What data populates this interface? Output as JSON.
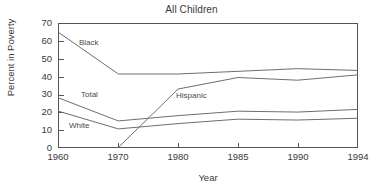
{
  "chart_data": {
    "type": "line",
    "title": "All Children",
    "xlabel": "Year",
    "ylabel": "Percent in Poverty",
    "categories": [
      "1960",
      "1970",
      "1980",
      "1985",
      "1990",
      "1994"
    ],
    "x": [
      1960,
      1970,
      1980,
      1985,
      1990,
      1994
    ],
    "ylim": [
      0,
      70
    ],
    "yticks": [
      0,
      10,
      20,
      30,
      40,
      50,
      60,
      70
    ],
    "ytick_labels": [
      "0",
      "10",
      "20",
      "30",
      "40",
      "50",
      "60",
      "70"
    ],
    "xtick_labels": [
      "1960",
      "1970",
      "1980",
      "1985",
      "1990",
      "1994"
    ],
    "grid": false,
    "legend": "inline-labels",
    "axis_scale": "categorical-even-spacing",
    "series": [
      {
        "name": "Black",
        "label": "Black",
        "color": "#6e6e6e",
        "values": [
          65,
          41.5,
          41.5,
          43,
          44.5,
          43.5
        ]
      },
      {
        "name": "Total",
        "label": "Total",
        "color": "#6e6e6e",
        "values": [
          28,
          15,
          18,
          20.5,
          20,
          21.5
        ]
      },
      {
        "name": "White",
        "label": "White",
        "color": "#6e6e6e",
        "values": [
          20.5,
          10.5,
          13.5,
          16,
          15.5,
          16.5
        ]
      },
      {
        "name": "Hispanic",
        "label": "Hispanic",
        "color": "#6e6e6e",
        "values": [
          null,
          0,
          33,
          39.5,
          38,
          41
        ]
      }
    ],
    "annotations": [
      {
        "text": "Black",
        "series": "Black"
      },
      {
        "text": "Total",
        "series": "Total"
      },
      {
        "text": "White",
        "series": "White"
      },
      {
        "text": "Hispanic",
        "series": "Hispanic"
      }
    ]
  },
  "axis": {
    "y_ticks": [
      {
        "label": "70"
      },
      {
        "label": "60"
      },
      {
        "label": "50"
      },
      {
        "label": "40"
      },
      {
        "label": "30"
      },
      {
        "label": "20"
      },
      {
        "label": "10"
      },
      {
        "label": "0"
      }
    ],
    "x_ticks": [
      {
        "label": "1960"
      },
      {
        "label": "1970"
      },
      {
        "label": "1980"
      },
      {
        "label": "1985"
      },
      {
        "label": "1990"
      },
      {
        "label": "1994"
      }
    ]
  },
  "colors": {
    "line": "#6e6e6e",
    "axis": "#555555",
    "text": "#3a3a3a",
    "background": "#ffffff"
  }
}
